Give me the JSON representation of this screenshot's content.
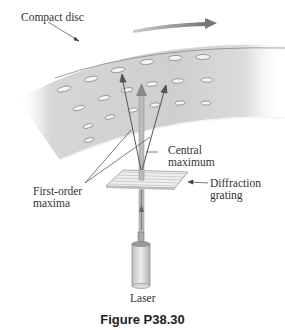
{
  "figure": {
    "caption": "Figure P38.30",
    "labels": {
      "compact_disc": "Compact disc",
      "central_maximum_line1": "Central",
      "central_maximum_line2": "maximum",
      "first_order_line1": "First-order",
      "first_order_line2": "maxima",
      "grating_line1": "Diffraction",
      "grating_line2": "grating",
      "laser": "Laser"
    },
    "colors": {
      "disc_fill": "#d2d2d2",
      "beam": "#8a8a8a",
      "arrow": "#666666",
      "text": "#333333"
    }
  }
}
